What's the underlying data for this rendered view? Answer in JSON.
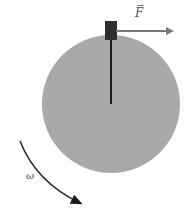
{
  "diagram": {
    "labels": {
      "force": "F",
      "angular_velocity": "ω"
    },
    "colors": {
      "disk": "#a9a9a9",
      "block": "#2e2e2e",
      "rod": "#1a1a1a",
      "force_arrow": "#7a7a7a",
      "omega_arrow": "#2a2a2a"
    },
    "elements": [
      {
        "name": "rotating-disk"
      },
      {
        "name": "block-on-rim"
      },
      {
        "name": "radius-rod"
      },
      {
        "name": "force-vector-arrow"
      },
      {
        "name": "angular-velocity-arrow"
      }
    ]
  }
}
